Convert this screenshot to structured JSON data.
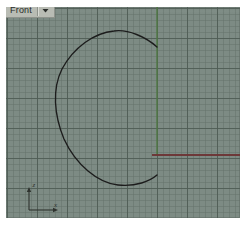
{
  "app": {
    "kind": "cad-viewport",
    "page_background": "#ffffff"
  },
  "viewport": {
    "name": "front-viewport",
    "title_label": "Front",
    "title_dropdown_icon": "chevron-down-icon",
    "background_color": "#7e8c85",
    "grid": {
      "minor_spacing_px": 6,
      "major_spacing_px": 30,
      "minor_color": "#606e66",
      "major_color": "#4e5c54",
      "visible": true
    },
    "bounds": {
      "x": 6,
      "y": 7,
      "width": 234,
      "height": 211
    }
  },
  "geometry": {
    "curve": {
      "name": "free-form-closed-curve",
      "color": "#1c1c1c",
      "stroke_width": 1.3,
      "description": "open teardrop / leaf shaped NURBS curve"
    },
    "construction_lines": [
      {
        "name": "vertical-green-axis-line",
        "orientation": "vertical",
        "color": "#4f7a42",
        "x": 157,
        "y_start": 7,
        "y_end": 155
      },
      {
        "name": "horizontal-red-axis-line",
        "orientation": "horizontal",
        "color": "#6e3535",
        "y": 155,
        "x_start": 152,
        "x_end": 240
      }
    ]
  },
  "axis_gizmo": {
    "name": "world-axis-indicator",
    "vertical_axis_label": "z",
    "horizontal_axis_label": "x",
    "color": "#2f332f"
  }
}
